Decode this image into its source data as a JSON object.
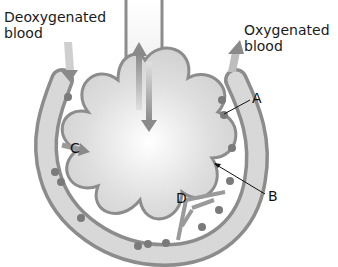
{
  "diagram": {
    "labels": {
      "deoxygenated": "Deoxygenated\nblood",
      "deoxygenated_line1": "Deoxygenated",
      "deoxygenated_line2": "blood",
      "oxygenated_line1": "Oxygenated",
      "oxygenated_line2": "blood",
      "a": "A",
      "b": "B",
      "c": "C",
      "d": "D"
    },
    "colors": {
      "vessel_fill": "#d6d6d6",
      "vessel_wall": "#8c8c8c",
      "cell": "#7a7a7a",
      "alveolus_fill": "#dcdcdc",
      "arrow": "#8a8a8a",
      "text": "#1a1a1a"
    }
  }
}
